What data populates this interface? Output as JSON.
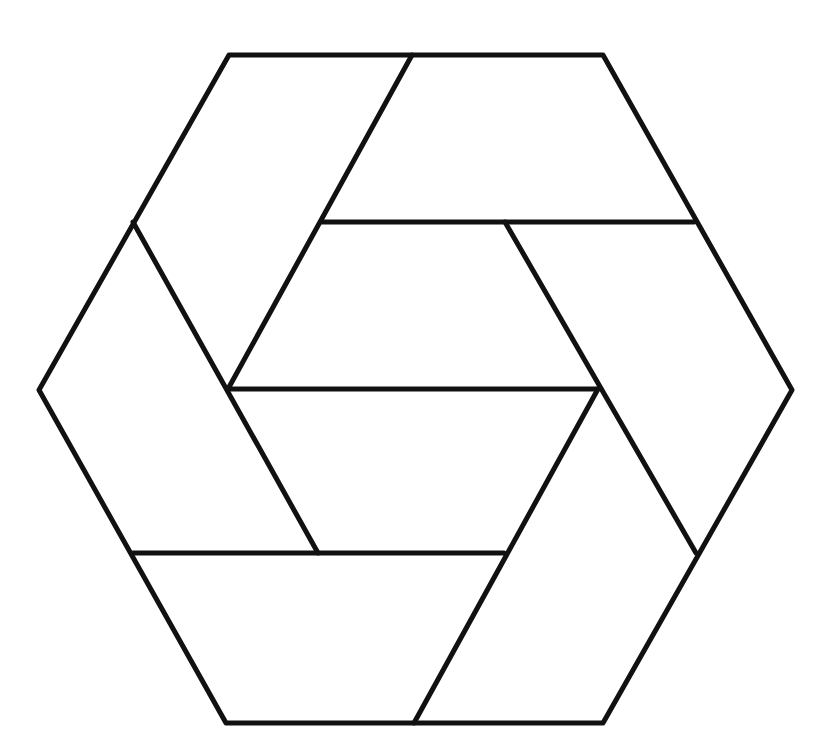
{
  "diagram": {
    "stroke_color": "#111111",
    "background_color": "#ffffff",
    "outline": {
      "shape": "hexagon",
      "vertices": [
        [
          229,
          55
        ],
        [
          603,
          55
        ],
        [
          792,
          390
        ],
        [
          603,
          723
        ],
        [
          226,
          723
        ],
        [
          39,
          390
        ]
      ]
    },
    "segments": [
      {
        "name": "top-inner-horizontal",
        "from": [
          322,
          222
        ],
        "to": [
          694,
          222
        ]
      },
      {
        "name": "middle-horizontal",
        "from": [
          228,
          389
        ],
        "to": [
          598,
          389
        ]
      },
      {
        "name": "lower-inner-horizontal",
        "from": [
          133,
          553
        ],
        "to": [
          504,
          553
        ]
      },
      {
        "name": "upper-left-diagonal",
        "from": [
          412,
          55
        ],
        "to": [
          228,
          389
        ]
      },
      {
        "name": "left-descending-diagonal",
        "from": [
          133,
          222
        ],
        "to": [
          318,
          553
        ]
      },
      {
        "name": "right-descending-diagonal",
        "from": [
          505,
          222
        ],
        "to": [
          696,
          553
        ]
      },
      {
        "name": "lower-right-diagonal",
        "from": [
          598,
          389
        ],
        "to": [
          414,
          723
        ]
      }
    ]
  }
}
